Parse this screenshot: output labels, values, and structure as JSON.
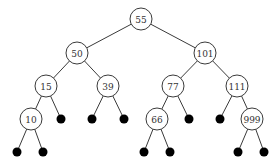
{
  "diagram": {
    "type": "binary-search-tree",
    "nodes": [
      {
        "id": "n55",
        "label": "55",
        "x": 141,
        "y": 19
      },
      {
        "id": "n50",
        "label": "50",
        "x": 77,
        "y": 53
      },
      {
        "id": "n101",
        "label": "101",
        "x": 205,
        "y": 53
      },
      {
        "id": "n15",
        "label": "15",
        "x": 46,
        "y": 86
      },
      {
        "id": "n39",
        "label": "39",
        "x": 108,
        "y": 86
      },
      {
        "id": "n77",
        "label": "77",
        "x": 173,
        "y": 86
      },
      {
        "id": "n111",
        "label": "111",
        "x": 237,
        "y": 86
      },
      {
        "id": "n10",
        "label": "10",
        "x": 31,
        "y": 119
      },
      {
        "id": "n66",
        "label": "66",
        "x": 157,
        "y": 119
      },
      {
        "id": "n999",
        "label": "999",
        "x": 252,
        "y": 119
      }
    ],
    "leaves": [
      {
        "id": "l1",
        "x": 61,
        "y": 119
      },
      {
        "id": "l2",
        "x": 92,
        "y": 119
      },
      {
        "id": "l3",
        "x": 124,
        "y": 119
      },
      {
        "id": "l4",
        "x": 189,
        "y": 119
      },
      {
        "id": "l5",
        "x": 220,
        "y": 119
      },
      {
        "id": "l6",
        "x": 17,
        "y": 152
      },
      {
        "id": "l7",
        "x": 43,
        "y": 152
      },
      {
        "id": "l8",
        "x": 144,
        "y": 152
      },
      {
        "id": "l9",
        "x": 170,
        "y": 152
      },
      {
        "id": "l10",
        "x": 238,
        "y": 152
      },
      {
        "id": "l11",
        "x": 264,
        "y": 152
      }
    ],
    "edges": [
      [
        "n55",
        "n50"
      ],
      [
        "n55",
        "n101"
      ],
      [
        "n50",
        "n15"
      ],
      [
        "n50",
        "n39"
      ],
      [
        "n101",
        "n77"
      ],
      [
        "n101",
        "n111"
      ],
      [
        "n15",
        "n10"
      ],
      [
        "n15",
        "l1"
      ],
      [
        "n39",
        "l2"
      ],
      [
        "n39",
        "l3"
      ],
      [
        "n77",
        "n66"
      ],
      [
        "n77",
        "l4"
      ],
      [
        "n111",
        "l5"
      ],
      [
        "n111",
        "n999"
      ],
      [
        "n10",
        "l6"
      ],
      [
        "n10",
        "l7"
      ],
      [
        "n66",
        "l8"
      ],
      [
        "n66",
        "l9"
      ],
      [
        "n999",
        "l10"
      ],
      [
        "n999",
        "l11"
      ]
    ],
    "node_radius": 11,
    "leaf_radius": 4.5
  }
}
